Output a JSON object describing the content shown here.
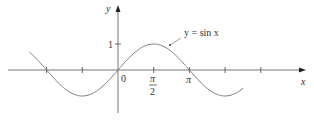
{
  "chart_data": {
    "type": "line",
    "title": "",
    "function_label": "y = sin x",
    "xlabel": "x",
    "ylabel": "y",
    "x_tick_labels": [
      {
        "value": 0,
        "label": "0"
      },
      {
        "value": 1.5708,
        "label_num": "π",
        "label_den": "2"
      },
      {
        "value": 3.1416,
        "label": "π"
      }
    ],
    "x_ticks": [
      -3.1416,
      -1.5708,
      0,
      1.5708,
      3.1416,
      4.7124,
      6.2832
    ],
    "y_ticks": [
      {
        "value": 1,
        "label": "1"
      }
    ],
    "xlim": [
      -3.9,
      5.6
    ],
    "ylim": [
      -1.5,
      2.5
    ],
    "grid": false,
    "legend": "none",
    "series": [
      {
        "name": "y = sin x",
        "fn": "sin",
        "x_range": [
          -3.9,
          5.5
        ]
      }
    ],
    "colors": {
      "curve": "#777777",
      "axis": "#555555",
      "text": "#333333"
    }
  }
}
